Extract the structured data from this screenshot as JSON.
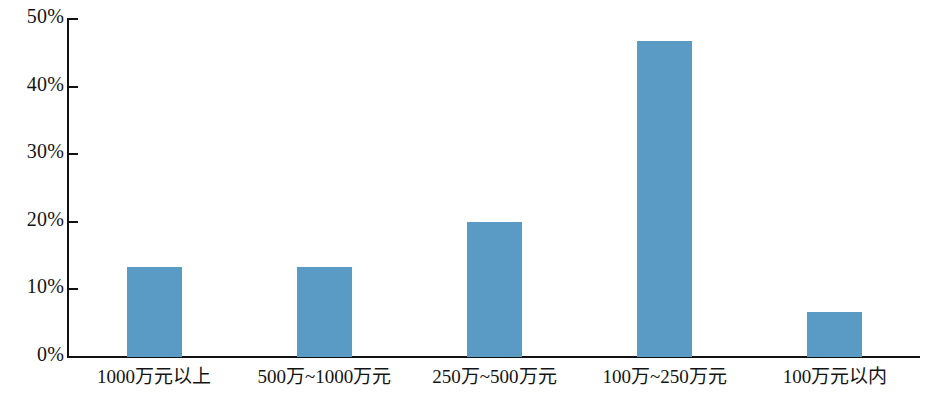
{
  "chart_data": {
    "type": "bar",
    "title": "",
    "subtitle": "",
    "xlabel": "",
    "ylabel": "",
    "categories": [
      "1000万元以上",
      "500万~1000万元",
      "250万~500万元",
      "100万~250万元",
      "100万元以内"
    ],
    "values": [
      13.3,
      13.3,
      20.0,
      46.7,
      6.7
    ],
    "value_labels": [
      "13.3%",
      "13.3%",
      "20.0%",
      "46.7%",
      "6.7%"
    ],
    "ylim": [
      0,
      50
    ],
    "ytick_values": [
      0,
      10,
      20,
      30,
      40,
      50
    ],
    "ytick_labels": [
      "0%",
      "10%",
      "20%",
      "30%",
      "40%",
      "50%"
    ],
    "grid": false,
    "legend": null,
    "legend_position": "none",
    "bar_color": "#5a9bc6",
    "axis_color": "#111111",
    "background_color": "#ffffff",
    "annotations": []
  }
}
